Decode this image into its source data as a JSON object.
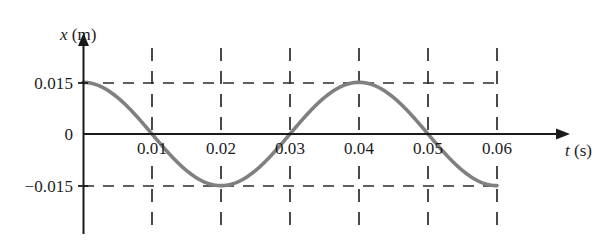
{
  "figure": {
    "background_color": "#ffffff",
    "axis_color": "#1b1b1b",
    "grid_color": "#2b2b2b",
    "curve_color": "#808080",
    "text_color": "#1b1b1b"
  },
  "axes": {
    "y_title_var": "x",
    "y_title_unit": "(m)",
    "x_title_var": "t",
    "x_title_unit": "(s)"
  },
  "ticks": {
    "y": [
      "0.015",
      "0",
      "−0.015"
    ],
    "x": [
      "0.01",
      "0.02",
      "0.03",
      "0.04",
      "0.05",
      "0.06"
    ]
  },
  "chart_data": {
    "type": "line",
    "title": "",
    "subtitle": "",
    "xlabel": "t (s)",
    "ylabel": "x (m)",
    "xlim": [
      0,
      0.0655
    ],
    "ylim": [
      -0.0235,
      0.0235
    ],
    "grid": true,
    "grid_style": "dashed",
    "legend": "none",
    "xticks": [
      0.01,
      0.02,
      0.03,
      0.04,
      0.05,
      0.06
    ],
    "xticklabels": [
      "0.01",
      "0.02",
      "0.03",
      "0.04",
      "0.05",
      "0.06"
    ],
    "yticks": [
      0.015,
      0,
      -0.015
    ],
    "yticklabels": [
      "0.015",
      "0",
      "−0.015"
    ],
    "annotations": [],
    "series": [
      {
        "name": "displacement",
        "equation": "x = 0.015 cos(2πt / 0.04)",
        "amplitude": 0.015,
        "period": 0.04,
        "phase": 0,
        "color": "#808080",
        "linewidth": 3.6,
        "x": [
          0,
          0.002,
          0.004,
          0.006,
          0.008,
          0.01,
          0.012,
          0.014,
          0.016,
          0.018,
          0.02,
          0.022,
          0.024,
          0.026,
          0.028,
          0.03,
          0.032,
          0.034,
          0.036,
          0.038,
          0.04,
          0.042,
          0.044,
          0.046,
          0.048,
          0.05,
          0.052,
          0.054,
          0.056,
          0.058,
          0.06
        ],
        "y": [
          0.015,
          0.01427,
          0.01214,
          0.00882,
          0.00464,
          0.0,
          -0.00464,
          -0.00882,
          -0.01214,
          -0.01427,
          -0.015,
          -0.01427,
          -0.01214,
          -0.00882,
          -0.00464,
          0.0,
          0.00464,
          0.00882,
          0.01214,
          0.01427,
          0.015,
          0.01427,
          0.01214,
          0.00882,
          0.00464,
          0.0,
          -0.00464,
          -0.00882,
          -0.01214,
          -0.01427,
          -0.015
        ]
      }
    ]
  }
}
